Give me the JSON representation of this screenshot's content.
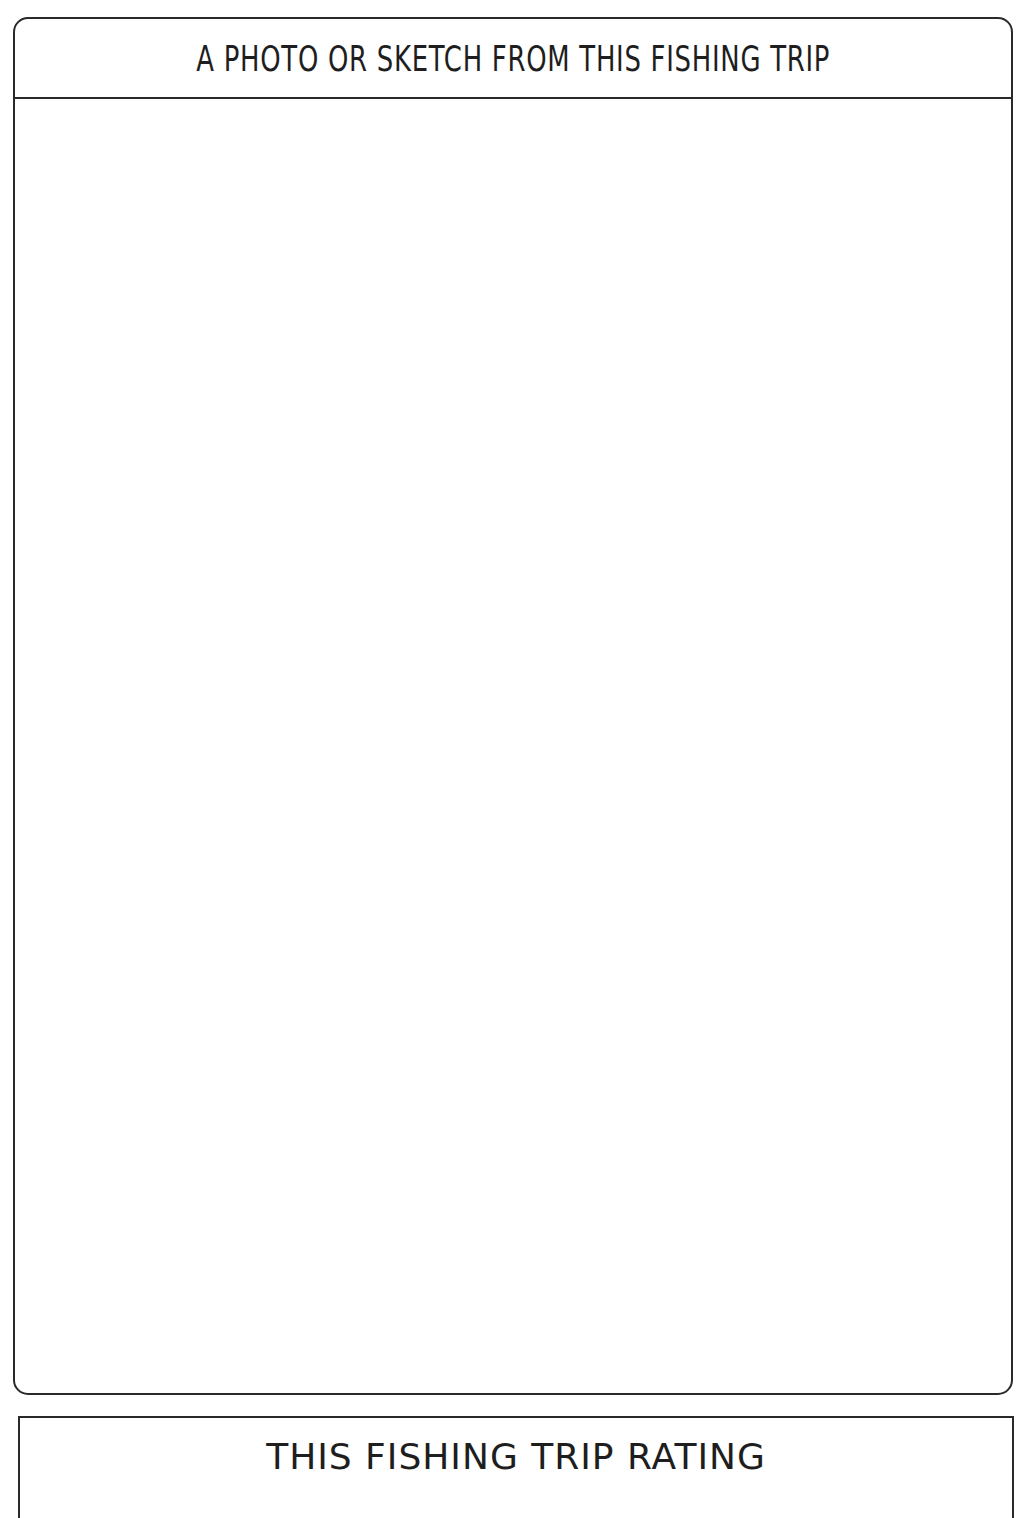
{
  "photo_section": {
    "title": "A PHOTO OR SKETCH FROM THIS FISHING TRIP"
  },
  "rating_section": {
    "title": "THIS FISHING TRIP RATING"
  }
}
